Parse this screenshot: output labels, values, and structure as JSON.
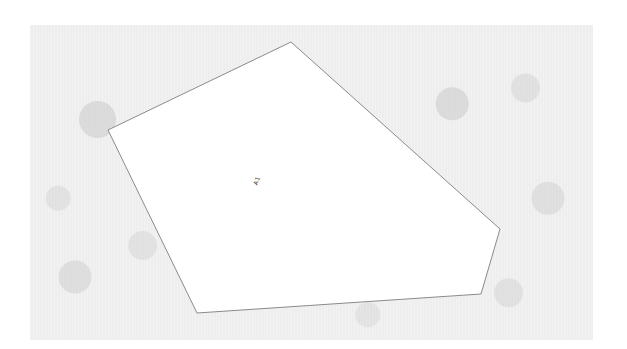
{
  "scene": {
    "background_color": "#eeeeee",
    "polygon_fill": "#ffffff",
    "polygon_stroke": "#8a8a8a",
    "polygon_points": [
      [
        291,
        42
      ],
      [
        500,
        229
      ],
      [
        481,
        294
      ],
      [
        197,
        313
      ],
      [
        108,
        130
      ]
    ]
  },
  "labels": {
    "region_label": "A1"
  }
}
